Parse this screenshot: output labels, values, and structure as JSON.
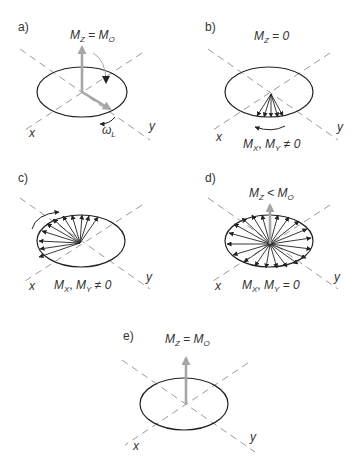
{
  "colors": {
    "background": "#ffffff",
    "ink": "#222222",
    "text": "#333333",
    "gray_vector": "#a6a6a6",
    "axis_dash": "#9a9a9a"
  },
  "panels": [
    {
      "id": "a",
      "label": "a)",
      "top_label": {
        "main": "M",
        "sub": "Z",
        "rel": " = ",
        "rhs_main": "M",
        "rhs_sub": "O"
      },
      "bottom_label": null,
      "omega_label": {
        "main": "ω",
        "sub": "L"
      },
      "axis_x": "x",
      "axis_y": "y",
      "description": "Net magnetization along z, tipped by RF pulse into xy plane, precessing at Larmor frequency"
    },
    {
      "id": "b",
      "label": "b)",
      "top_label": {
        "main": "M",
        "sub": "Z",
        "rel": " = ",
        "rhs_main": "0",
        "rhs_sub": ""
      },
      "bottom_label": {
        "a_main": "M",
        "a_sub": "X",
        "sep": ", ",
        "b_main": "M",
        "b_sub": "Y",
        "rel": " ≠ ",
        "rhs": "0"
      },
      "axis_x": "x",
      "axis_y": "y",
      "description": "Spins in phase in transverse plane"
    },
    {
      "id": "c",
      "label": "c)",
      "top_label": null,
      "bottom_label": {
        "a_main": "M",
        "a_sub": "X",
        "sep": ", ",
        "b_main": "M",
        "b_sub": "Y",
        "rel": " ≠ ",
        "rhs": "0"
      },
      "axis_x": "x",
      "axis_y": "y",
      "description": "Spins dephasing (fanning out)"
    },
    {
      "id": "d",
      "label": "d)",
      "top_label": {
        "main": "M",
        "sub": "Z",
        "rel": " < ",
        "rhs_main": "M",
        "rhs_sub": "O"
      },
      "bottom_label": {
        "a_main": "M",
        "a_sub": "X",
        "sep": ", ",
        "b_main": "M",
        "b_sub": "Y",
        "rel": " = ",
        "rhs": "0"
      },
      "axis_x": "x",
      "axis_y": "y",
      "description": "Spins fully dephased, longitudinal recovery"
    },
    {
      "id": "e",
      "label": "e)",
      "top_label": {
        "main": "M",
        "sub": "Z",
        "rel": " = ",
        "rhs_main": "M",
        "rhs_sub": "O"
      },
      "bottom_label": null,
      "axis_x": "x",
      "axis_y": "y",
      "description": "Full longitudinal recovery"
    }
  ]
}
